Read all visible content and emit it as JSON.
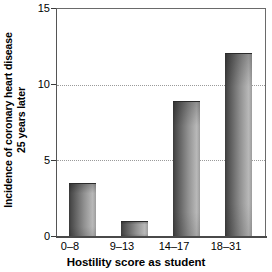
{
  "chart_data": {
    "type": "bar",
    "title": "",
    "xlabel": "Hostility score as student",
    "ylabel": "Incidence of coronary heart disease 25 years later",
    "ylabel_line1": "Incidence of coronary heart disease",
    "ylabel_line2": "25 years later",
    "categories": [
      "0–8",
      "9–13",
      "14–17",
      "18–31"
    ],
    "values": [
      3.5,
      1.0,
      8.9,
      12.1
    ],
    "ylim": [
      0,
      15
    ],
    "yticks": [
      0,
      5,
      10,
      15
    ],
    "ytick_labels": [
      "0",
      "5",
      "10",
      "15"
    ],
    "gridlines": [
      5,
      10
    ],
    "grid": "horizontal-dotted",
    "legend": "none",
    "series": [
      {
        "name": "Incidence of coronary heart disease 25 years later",
        "values": [
          3.5,
          1.0,
          8.9,
          12.1
        ]
      }
    ],
    "bar_fill": "#8f8f8f",
    "axis_color": "#555555",
    "grid_color": "#9a9a9a"
  }
}
